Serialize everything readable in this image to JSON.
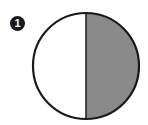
{
  "figure": {
    "label": "1",
    "shaded_fraction": 0.5,
    "shaded_side": "right",
    "colors": {
      "shaded": "#8a8a8a",
      "unshaded": "#ffffff",
      "outline": "#1a1a1a",
      "badge": "#1a1a1a"
    }
  }
}
